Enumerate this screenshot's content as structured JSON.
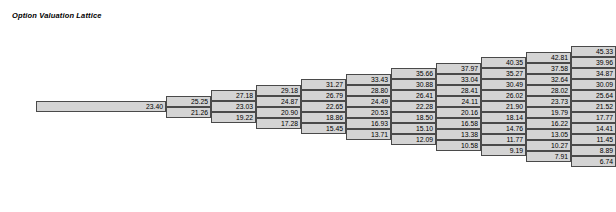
{
  "title": "Option Valuation Lattice",
  "chart_data": {
    "type": "table",
    "title": "Option Valuation Lattice",
    "xlabel": "",
    "ylabel": "",
    "grid": false,
    "legend": "none",
    "columns": [
      {
        "step": 0,
        "values": [
          23.4
        ]
      },
      {
        "step": 1,
        "values": [
          25.25,
          21.26
        ]
      },
      {
        "step": 2,
        "values": [
          27.18,
          23.03,
          19.22
        ]
      },
      {
        "step": 3,
        "values": [
          29.18,
          24.87,
          20.9,
          17.28
        ]
      },
      {
        "step": 4,
        "values": [
          31.27,
          26.79,
          22.65,
          18.86,
          15.45
        ]
      },
      {
        "step": 5,
        "values": [
          33.43,
          28.8,
          24.49,
          20.53,
          16.93,
          13.71
        ]
      },
      {
        "step": 6,
        "values": [
          35.66,
          30.88,
          26.41,
          22.28,
          18.5,
          15.1,
          12.09
        ]
      },
      {
        "step": 7,
        "values": [
          37.97,
          33.04,
          28.41,
          24.11,
          20.16,
          16.58,
          13.38,
          10.58
        ]
      },
      {
        "step": 8,
        "values": [
          40.35,
          35.27,
          30.49,
          26.02,
          21.9,
          18.14,
          14.76,
          11.77,
          9.19
        ]
      },
      {
        "step": 9,
        "values": [
          42.81,
          37.58,
          32.64,
          28.02,
          23.73,
          19.79,
          16.22,
          13.05,
          10.27,
          7.91
        ]
      },
      {
        "step": 10,
        "values": [
          45.33,
          39.96,
          34.87,
          30.09,
          25.64,
          21.52,
          17.77,
          14.41,
          11.45,
          8.89,
          6.74
        ]
      }
    ]
  },
  "colors": {
    "cell_fill": "#d4d4d4",
    "cell_border": "#4a4a4a",
    "text": "#000000",
    "background": "#ffffff"
  }
}
